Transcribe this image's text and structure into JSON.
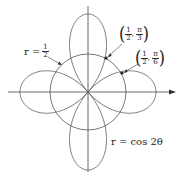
{
  "labels": {
    "circle_r_prefix": "r =",
    "circle_num": "1",
    "circle_den": "2",
    "rose_eq": "r = cos 2θ",
    "point1": {
      "r_num": "1",
      "r_den": "2",
      "sep": ",",
      "th_num": "π",
      "th_den": "3"
    },
    "point2": {
      "r_num": "1",
      "r_den": "2",
      "sep": ",",
      "th_num": "π",
      "th_den": "6"
    }
  },
  "colors": {
    "curve": "#555555",
    "axis": "#444444",
    "text": "#222222"
  }
}
